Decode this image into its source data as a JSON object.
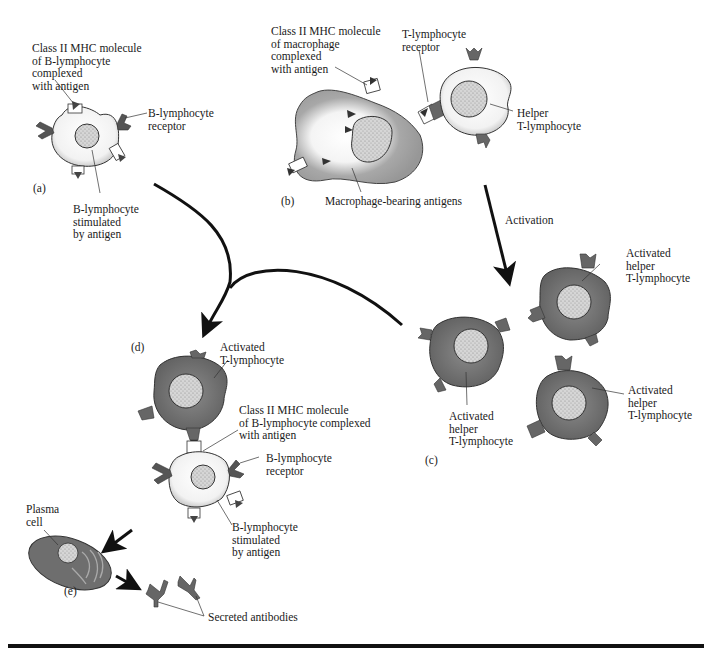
{
  "figure": {
    "panels": [
      {
        "id": "a",
        "label": "(a)"
      },
      {
        "id": "b",
        "label": "(b)"
      },
      {
        "id": "c",
        "label": "(c)"
      },
      {
        "id": "d",
        "label": "(d)"
      },
      {
        "id": "e",
        "label": "(e)"
      }
    ],
    "labels": {
      "a_mhc": "Class II MHC molecule\nof B-lymphocyte\ncomplexed\nwith antigen",
      "a_receptor": "B-lymphocyte\nreceptor",
      "a_stimulated": "B-lymphocyte\nstimulated\nby antigen",
      "b_mhc": "Class II MHC molecule\nof macrophage\ncomplexed\nwith antigen",
      "b_tcr": "T-lymphocyte\nreceptor",
      "b_helper": "Helper\nT-lymphocyte",
      "b_macrophage": "Macrophage-bearing antigens",
      "activation": "Activation",
      "c_top": "Activated\nhelper\nT-lymphocyte",
      "c_left": "Activated\nhelper\nT-lymphocyte",
      "c_right": "Activated\nhelper\nT-lymphocyte",
      "d_activated": "Activated\nT-lymphocyte",
      "d_mhc": "Class II MHC molecule\nof B-lymphocyte complexed\nwith antigen",
      "d_receptor": "B-lymphocyte\nreceptor",
      "d_stimulated": "B-lymphocyte\nstimulated\nby antigen",
      "e_plasma": "Plasma\ncell",
      "e_antibodies": "Secreted antibodies"
    },
    "colors": {
      "activated_cell": "#6e6e6e",
      "b_cell": "#e9e9e9",
      "macrophage": "#9a9a9a",
      "nucleus": "#cfcfcf",
      "receptor": "#555555",
      "arrow": "#111111"
    }
  }
}
